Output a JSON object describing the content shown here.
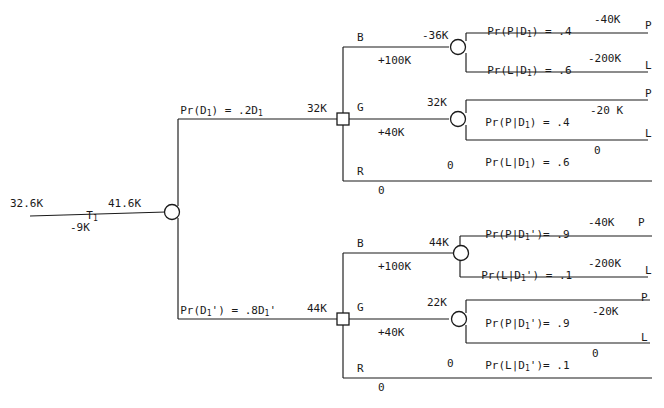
{
  "diagram": {
    "root": {
      "left_value": "32.6K",
      "test_label": "T",
      "test_sub": "1",
      "test_cost": "-9K",
      "right_value": "41.6K"
    },
    "branches": [
      {
        "id": "upper",
        "prob_label_pre": "Pr(D",
        "prob_label_sub": "1",
        "prob_label_post": ") = .2D",
        "prob_label_post_sub": "1",
        "decision_value": "32K",
        "actions": [
          {
            "name": "B",
            "payoff": "+100K"
          },
          {
            "name": "G",
            "payoff": "+40K"
          },
          {
            "name": "R",
            "payoff": "0",
            "terminal_value": "0"
          }
        ],
        "chance_nodes": [
          {
            "for_action": "B",
            "value": "-36K",
            "outcomes": [
              {
                "prob_text": "Pr(P|D",
                "sub": "1",
                "prob_text_end": ") = .4",
                "payoff": "-40K",
                "terminal": "P"
              },
              {
                "prob_text": "Pr(L|D",
                "sub": "1",
                "prob_text_end": ") = .6",
                "payoff": "-200K",
                "terminal": "L"
              }
            ]
          },
          {
            "for_action": "G",
            "value": "32K",
            "outcomes": [
              {
                "prob_text": "Pr(P|D",
                "sub": "1",
                "prob_text_end": ") = .4",
                "payoff": "-20 K",
                "terminal": "P"
              },
              {
                "prob_text": "Pr(L|D",
                "sub": "1",
                "prob_text_end": ") = .6",
                "payoff": "0",
                "terminal": "L"
              }
            ]
          }
        ]
      },
      {
        "id": "lower",
        "prob_label_pre": "Pr(D",
        "prob_label_sub": "1",
        "prob_label_prime": "'",
        "prob_label_post": ") = .8D",
        "prob_label_post_sub": "1",
        "decision_value": "44K",
        "actions": [
          {
            "name": "B",
            "payoff": "+100K"
          },
          {
            "name": "G",
            "payoff": "+40K"
          },
          {
            "name": "R",
            "payoff": "0",
            "terminal_value": "0"
          }
        ],
        "chance_nodes": [
          {
            "for_action": "B",
            "value": "44K",
            "outcomes": [
              {
                "prob_text": "Pr(P|D",
                "sub": "1",
                "prime": "'",
                "prob_text_end": ")= .9",
                "payoff": "-40K",
                "terminal": "P"
              },
              {
                "prob_text": "Pr(L|D",
                "sub": "1",
                "prime": "'",
                "prob_text_end": ") = .1",
                "payoff": "-200K",
                "terminal": "L"
              }
            ]
          },
          {
            "for_action": "G",
            "value": "22K",
            "outcomes": [
              {
                "prob_text": "Pr(P|D",
                "sub": "1",
                "prime": "'",
                "prob_text_end": ")= .9",
                "payoff": "-20K",
                "terminal": "P"
              },
              {
                "prob_text": "Pr(L|D",
                "sub": "1",
                "prime": "'",
                "prob_text_end": ")= .1",
                "payoff": "0",
                "terminal": "L"
              }
            ]
          }
        ]
      }
    ],
    "colors": {
      "ink": "#1a1a1a",
      "background": "#ffffff"
    }
  },
  "text": {
    "root_left": "32.6K",
    "root_T": "T",
    "root_T_sub": "1",
    "root_cost": "-9K",
    "root_right": "41.6K",
    "up_prob_a": "Pr(D",
    "up_prob_b": "1",
    "up_prob_c": ") = .2D",
    "up_prob_d": "1",
    "up_dec_val": "32K",
    "up_B": "B",
    "up_B_pay": "+100K",
    "up_G": "G",
    "up_G_pay": "+40K",
    "up_R": "R",
    "up_R_pay": "0",
    "up_R_term": "0",
    "up_cn1_val": "-36K",
    "up_cn1_o1_a": "Pr(P|D",
    "up_cn1_o1_b": "1",
    "up_cn1_o1_c": ") = .4",
    "up_cn1_o1_pay": "-40K",
    "up_cn1_o1_term": "P",
    "up_cn1_o2_a": "Pr(L|D",
    "up_cn1_o2_b": "1",
    "up_cn1_o2_c": ") = .6",
    "up_cn1_o2_pay": "-200K",
    "up_cn1_o2_term": "L",
    "up_cn2_val": "32K",
    "up_cn2_o1_a": "Pr(P|D",
    "up_cn2_o1_b": "1",
    "up_cn2_o1_c": ") = .4",
    "up_cn2_o1_pay": "-20 K",
    "up_cn2_o1_term": "P",
    "up_cn2_o2_a": "Pr(L|D",
    "up_cn2_o2_b": "1",
    "up_cn2_o2_c": ") = .6",
    "up_cn2_o2_pay": "0",
    "up_cn2_o2_term": "L",
    "lo_prob_a": "Pr(D",
    "lo_prob_b": "1",
    "lo_prob_prime": "'",
    "lo_prob_c": ") = .8D",
    "lo_prob_d": "1",
    "lo_prob_prime2": "'",
    "lo_dec_val": "44K",
    "lo_B": "B",
    "lo_B_pay": "+100K",
    "lo_G": "G",
    "lo_G_pay": "+40K",
    "lo_R": "R",
    "lo_R_pay": "0",
    "lo_R_term": "0",
    "lo_cn1_val": "44K",
    "lo_cn1_o1_a": "Pr(P|D",
    "lo_cn1_o1_b": "1",
    "lo_cn1_o1_prime": "'",
    "lo_cn1_o1_c": ")= .9",
    "lo_cn1_o1_pay": "-40K",
    "lo_cn1_o1_term": "P",
    "lo_cn1_o2_a": "Pr(L|D",
    "lo_cn1_o2_b": "1",
    "lo_cn1_o2_prime": "'",
    "lo_cn1_o2_c": ") = .1",
    "lo_cn1_o2_pay": "-200K",
    "lo_cn1_o2_term": "L",
    "lo_cn2_val": "22K",
    "lo_cn2_o1_a": "Pr(P|D",
    "lo_cn2_o1_b": "1",
    "lo_cn2_o1_prime": "'",
    "lo_cn2_o1_c": ")= .9",
    "lo_cn2_o1_pay": "-20K",
    "lo_cn2_o1_term": "P",
    "lo_cn2_o2_a": "Pr(L|D",
    "lo_cn2_o2_b": "1",
    "lo_cn2_o2_prime": "'",
    "lo_cn2_o2_c": ")= .1",
    "lo_cn2_o2_pay": "0",
    "lo_cn2_o2_term": "L"
  }
}
